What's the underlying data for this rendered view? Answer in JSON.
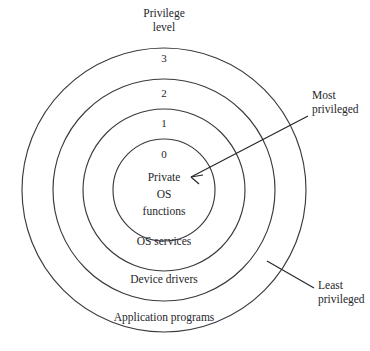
{
  "diagram": {
    "title": "Privilege level",
    "header": {
      "line1": "Privilege",
      "line2": "level"
    },
    "geometry": {
      "center_x": 164,
      "center_y": 190,
      "radii": [
        51,
        81,
        111,
        142
      ],
      "stroke_color": "#3a3a3f",
      "background": "#ffffff"
    },
    "rings": [
      {
        "level": "3",
        "label": "Application programs",
        "num_x": 164,
        "num_y": 58,
        "label_x": 164,
        "label_y": 318
      },
      {
        "level": "2",
        "label": "Device drivers",
        "num_x": 164,
        "num_y": 93,
        "label_x": 164,
        "label_y": 280
      },
      {
        "level": "1",
        "label": "OS services",
        "num_x": 164,
        "num_y": 123,
        "label_x": 164,
        "label_y": 242
      },
      {
        "level": "0",
        "label": "",
        "num_x": 164,
        "num_y": 154,
        "label_x": 164,
        "label_y": 0
      }
    ],
    "core": {
      "line1": "Private",
      "line2": "OS",
      "line3": "functions"
    },
    "callouts": [
      {
        "name": "most-privileged",
        "line1": "Most",
        "line2": "privileged",
        "text_x": 312,
        "text_y": 88,
        "leader_x1": 308,
        "leader_y1": 116,
        "leader_x2": 191,
        "leader_y2": 177
      },
      {
        "name": "least-privileged",
        "line1": "Least",
        "line2": "privileged",
        "text_x": 318,
        "text_y": 278,
        "leader_x1": 267,
        "leader_y1": 261,
        "leader_x2": 314,
        "leader_y2": 288
      }
    ]
  }
}
